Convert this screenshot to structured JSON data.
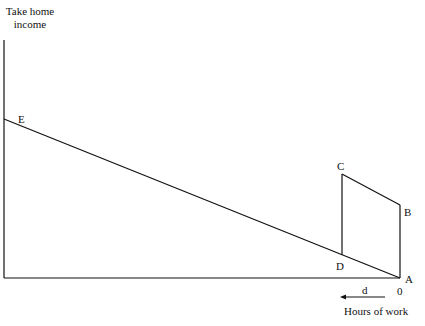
{
  "diagram": {
    "y_axis_label": [
      "Take home",
      "income"
    ],
    "x_axis_label": "Hours of work",
    "points": {
      "E": "E",
      "C": "C",
      "B": "B",
      "D": "D",
      "A": "A"
    },
    "origin_label": "0",
    "distance_label": "d",
    "arrow_direction": "left"
  }
}
